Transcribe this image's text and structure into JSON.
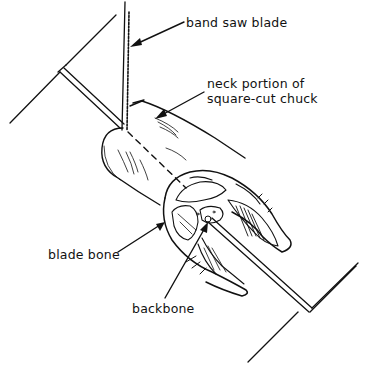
{
  "figure": {
    "type": "line-drawing",
    "labels": {
      "band_saw_blade": "band saw blade",
      "neck_line1": "neck portion of",
      "neck_line2": "square-cut chuck",
      "blade_bone": "blade bone",
      "backbone": "backbone"
    },
    "colors": {
      "ink": "#111111",
      "background": "#ffffff"
    }
  }
}
